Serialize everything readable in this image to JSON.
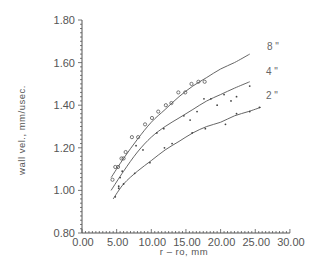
{
  "chart_data": {
    "type": "scatter",
    "title": "",
    "xlabel": "r  –  ro,  mm",
    "ylabel": "wall  vel.,  mm/usec.",
    "xlim": [
      0,
      30
    ],
    "ylim": [
      0.8,
      1.8
    ],
    "xticks": [
      0,
      5,
      10,
      15,
      20,
      25,
      30
    ],
    "xtick_labels": [
      "0.00",
      "5.00",
      "10.00",
      "15.00",
      "20.00",
      "25.00",
      "30.00"
    ],
    "yticks": [
      0.8,
      1.0,
      1.2,
      1.4,
      1.6,
      1.8
    ],
    "ytick_labels": [
      "0.80",
      "1.00",
      "1.20",
      "1.40",
      "1.60",
      "1.80"
    ],
    "grid": false,
    "legend_position": "inline labels at right end of curves",
    "series": [
      {
        "name": "8\"",
        "marker": "circle",
        "color": "#555555",
        "fit_curve": {
          "x": [
            4.2,
            6,
            8,
            10,
            12,
            14,
            16,
            18,
            20,
            22,
            24.2
          ],
          "y": [
            1.06,
            1.15,
            1.24,
            1.32,
            1.38,
            1.44,
            1.49,
            1.53,
            1.57,
            1.6,
            1.64
          ]
        },
        "points": {
          "x": [
            4.4,
            4.8,
            5.2,
            5.7,
            6.0,
            6.3,
            7.2,
            8.1,
            9.1,
            10.1,
            11.0,
            12.1,
            12.9,
            13.9,
            14.9,
            15.8,
            16.8,
            17.7
          ],
          "y": [
            1.05,
            1.11,
            1.11,
            1.15,
            1.15,
            1.18,
            1.25,
            1.25,
            1.31,
            1.34,
            1.37,
            1.4,
            1.41,
            1.46,
            1.46,
            1.5,
            1.51,
            1.51
          ]
        }
      },
      {
        "name": "4\"",
        "marker": "dot",
        "color": "#555555",
        "fit_curve": {
          "x": [
            4.2,
            6,
            8,
            10,
            12,
            14,
            16,
            18,
            20,
            22,
            24.2
          ],
          "y": [
            1.0,
            1.09,
            1.18,
            1.25,
            1.3,
            1.34,
            1.38,
            1.42,
            1.45,
            1.48,
            1.51
          ]
        },
        "points": {
          "x": [
            5.3,
            5.5,
            5.8,
            7.8,
            8.8,
            10.8,
            11.8,
            14.7,
            15.6,
            16.6,
            17.6,
            18.6,
            19.5,
            20.5,
            21.5,
            22.3,
            24.2
          ],
          "y": [
            1.02,
            1.06,
            1.09,
            1.21,
            1.19,
            1.27,
            1.29,
            1.35,
            1.33,
            1.37,
            1.43,
            1.43,
            1.4,
            1.45,
            1.42,
            1.44,
            1.49
          ]
        }
      },
      {
        "name": "2\"",
        "marker": "dot",
        "color": "#555555",
        "fit_curve": {
          "x": [
            4.5,
            6,
            8,
            10,
            12,
            14,
            16,
            18,
            20,
            22,
            24,
            25.8
          ],
          "y": [
            0.96,
            1.03,
            1.09,
            1.14,
            1.19,
            1.23,
            1.27,
            1.3,
            1.32,
            1.35,
            1.37,
            1.39
          ]
        },
        "points": {
          "x": [
            4.8,
            5.3,
            6.0,
            7.6,
            9.8,
            11.9,
            13.0,
            15.9,
            17.8,
            20.7,
            22.3,
            24.2,
            25.6
          ],
          "y": [
            0.97,
            1.01,
            1.03,
            1.08,
            1.13,
            1.2,
            1.22,
            1.27,
            1.29,
            1.31,
            1.36,
            1.37,
            1.39
          ]
        }
      }
    ]
  },
  "series_labels": [
    {
      "text": "8 \"",
      "x": 267,
      "y": 50
    },
    {
      "text": "4 \"",
      "x": 266,
      "y": 75
    },
    {
      "text": "2 \"",
      "x": 266,
      "y": 99
    }
  ],
  "layout": {
    "x0px": 82,
    "xPerUnit": 6.93,
    "y0px": 233,
    "yPerUnit": 213
  }
}
